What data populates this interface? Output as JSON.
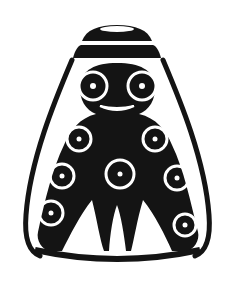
{
  "image": {
    "description": "Black and white stylized vessel with figure decoration",
    "colors": {
      "ink": "#141414",
      "paper": "#ffffff"
    },
    "eyes": [
      {
        "cx": 93,
        "cy": 86
      },
      {
        "cx": 142,
        "cy": 86
      }
    ],
    "body_circles": [
      {
        "cx": 79,
        "cy": 139,
        "r": 12
      },
      {
        "cx": 155,
        "cy": 139,
        "r": 12
      },
      {
        "cx": 62,
        "cy": 176,
        "r": 12
      },
      {
        "cx": 120,
        "cy": 174,
        "r": 15
      },
      {
        "cx": 177,
        "cy": 178,
        "r": 12
      },
      {
        "cx": 51,
        "cy": 213,
        "r": 13
      },
      {
        "cx": 185,
        "cy": 225,
        "r": 11
      }
    ]
  }
}
